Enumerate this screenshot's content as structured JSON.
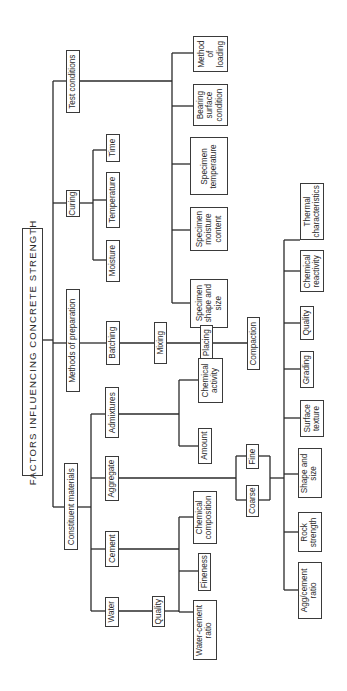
{
  "diagram": {
    "title": "FACTORS INFLUENCING CONCRETE STRENGTH",
    "level1": {
      "test_conditions": "Test conditions",
      "curing": "Curing",
      "methods_of_preparation": "Methods of preparation",
      "constituent_materials": "Constituent materials"
    },
    "test_conditions": {
      "method_of_loading": "Method\nof\nloading",
      "bearing_surface_condition": "Bearing\nsurface\ncondition",
      "specimen_temperature": "Specimen\ntemperature",
      "specimen_moisture_content": "Specimen\nmoisture\ncontent",
      "specimen_shape_and_size": "Specimen\nshape and\nsize"
    },
    "curing": {
      "time": "Time",
      "temperature": "Temperature",
      "moisture": "Moisture"
    },
    "methods_of_preparation": {
      "batching": "Batching",
      "mixing": "Mixing",
      "placing": "Placing",
      "compaction": "Compaction"
    },
    "constituent_materials": {
      "admixtures": "Admixtures",
      "aggregate": "Aggregate",
      "cement": "Cement",
      "water": "Water"
    },
    "admixtures": {
      "chemical_activity": "Chemical\nactivity",
      "amount": "Amount"
    },
    "aggregate": {
      "fine": "Fine",
      "coarse": "Coarse",
      "thermal_characteristics": "Thermal\ncharacteristics",
      "chemical_reactivity": "Chemical\nreactivity",
      "quality": "Quality",
      "grading": "Grading",
      "surface_texture": "Surface\ntexture",
      "shape_and_size": "Shape and\nsize",
      "rock_strength": "Rock\nstrength",
      "agg_cement_ratio": "Agg/cement\nratio"
    },
    "cement": {
      "chemical_composition": "Chemical\ncomposition",
      "fineness": "Fineness"
    },
    "water": {
      "quality": "Quality",
      "water_cement_ratio": "Water-cement\nratio"
    }
  }
}
